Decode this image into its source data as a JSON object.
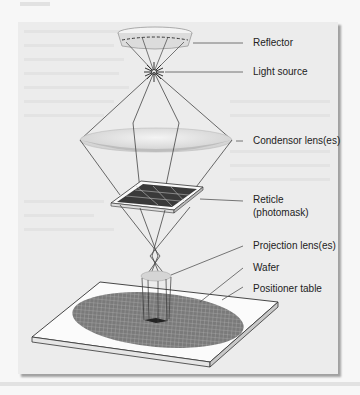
{
  "figure": {
    "type": "Photolithography exposure system schematic",
    "labels": {
      "reflector": "Reflector",
      "light_source": "Light source",
      "condensor": "Condensor lens(es)",
      "reticle_line1": "Reticle",
      "reticle_line2": "(photomask)",
      "projection": "Projection lens(es)",
      "wafer": "Wafer",
      "positioner": "Positioner table"
    },
    "components": [
      {
        "id": "reflector",
        "icon": "reflector-icon"
      },
      {
        "id": "light-source",
        "icon": "light-source-icon"
      },
      {
        "id": "condensor-lens",
        "icon": "lens-icon"
      },
      {
        "id": "reticle",
        "icon": "photomask-icon"
      },
      {
        "id": "projection-lens",
        "icon": "lens-icon"
      },
      {
        "id": "wafer",
        "icon": "wafer-icon"
      },
      {
        "id": "positioner-table",
        "icon": "table-icon"
      }
    ]
  }
}
